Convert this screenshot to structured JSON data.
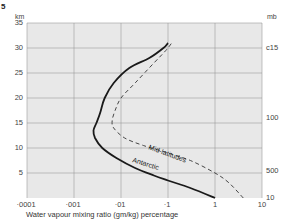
{
  "figure_number": "5",
  "chart_data": {
    "type": "line",
    "title": "",
    "xlabel": "Water vapour mixing ratio (gm/kg) percentage",
    "ylabel": "km",
    "ylabel_right": "mb",
    "x_scale": "log",
    "xlim": [
      0.0001,
      10
    ],
    "ylim": [
      0,
      35
    ],
    "x_tick_labels": [
      "·0001",
      "·001",
      "·01",
      "·1",
      "1",
      "10"
    ],
    "x_ticks": [
      0.0001,
      0.001,
      0.01,
      0.1,
      1,
      10
    ],
    "y_ticks": [
      5,
      10,
      15,
      20,
      25,
      30,
      35
    ],
    "y_tick_labels": [
      "5",
      "10",
      "15",
      "20",
      "25",
      "30",
      "35"
    ],
    "right_axis_labels": [
      {
        "label": "c15",
        "km": 30
      },
      {
        "label": "100",
        "km": 16
      },
      {
        "label": "500",
        "km": 5.5
      },
      {
        "label": "10",
        "km": 0
      }
    ],
    "grid": true,
    "series": [
      {
        "name": "Antarctic",
        "style": "solid",
        "points": [
          {
            "x": 1.0,
            "y": 0
          },
          {
            "x": 0.3,
            "y": 2
          },
          {
            "x": 0.1,
            "y": 3.5
          },
          {
            "x": 0.05,
            "y": 4.5
          },
          {
            "x": 0.02,
            "y": 6
          },
          {
            "x": 0.008,
            "y": 8
          },
          {
            "x": 0.004,
            "y": 10
          },
          {
            "x": 0.0028,
            "y": 12
          },
          {
            "x": 0.0026,
            "y": 13.5
          },
          {
            "x": 0.003,
            "y": 15
          },
          {
            "x": 0.0036,
            "y": 17
          },
          {
            "x": 0.0045,
            "y": 20
          },
          {
            "x": 0.007,
            "y": 23
          },
          {
            "x": 0.015,
            "y": 26
          },
          {
            "x": 0.04,
            "y": 28
          },
          {
            "x": 0.08,
            "y": 30
          },
          {
            "x": 0.1,
            "y": 31
          }
        ]
      },
      {
        "name": "Mid-latitudes",
        "style": "dashed",
        "points": [
          {
            "x": 4.0,
            "y": 0
          },
          {
            "x": 2.0,
            "y": 3
          },
          {
            "x": 1.0,
            "y": 5
          },
          {
            "x": 0.3,
            "y": 7.5
          },
          {
            "x": 0.1,
            "y": 9
          },
          {
            "x": 0.03,
            "y": 10.5
          },
          {
            "x": 0.012,
            "y": 12
          },
          {
            "x": 0.007,
            "y": 14
          },
          {
            "x": 0.0065,
            "y": 15.5
          },
          {
            "x": 0.0075,
            "y": 17.5
          },
          {
            "x": 0.01,
            "y": 20
          },
          {
            "x": 0.02,
            "y": 23
          },
          {
            "x": 0.05,
            "y": 27
          },
          {
            "x": 0.09,
            "y": 29.5
          },
          {
            "x": 0.12,
            "y": 31
          }
        ]
      }
    ]
  },
  "labels": {
    "km_unit": "km",
    "mb_unit": "mb",
    "antarctic": "Antarctic",
    "mid_latitudes": "Mid-latitudes"
  }
}
